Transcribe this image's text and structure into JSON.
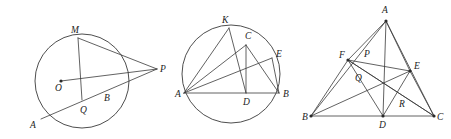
{
  "page": {
    "width": 451,
    "height": 139,
    "background": "#ffffff",
    "ink_color": "#3a3a3a",
    "label_color": "#222222"
  },
  "figures": [
    {
      "id": "figure-1",
      "name": "circle-with-external-point",
      "type": "circle-diagram",
      "bounds": {
        "x": 0,
        "y": 0,
        "width": 160,
        "height": 139
      },
      "circle": {
        "cx": 82,
        "cy": 81,
        "r": 47
      },
      "points": [
        {
          "key": "O",
          "label": "O",
          "x": 61,
          "y": 81,
          "label_x": 55,
          "label_y": 91,
          "dot": true
        },
        {
          "key": "M",
          "label": "M",
          "x": 78,
          "y": 38,
          "label_x": 71,
          "label_y": 33,
          "dot": false
        },
        {
          "key": "P",
          "label": "P",
          "x": 157,
          "y": 69,
          "label_x": 160,
          "label_y": 72,
          "dot": false
        },
        {
          "key": "A",
          "label": "A",
          "x": 41,
          "y": 119,
          "label_x": 30,
          "label_y": 128,
          "dot": false
        },
        {
          "key": "B",
          "label": "B",
          "x": 105,
          "y": 92,
          "label_x": 104,
          "label_y": 101,
          "dot": false
        },
        {
          "key": "Q",
          "label": "Q",
          "x": 82,
          "y": 100,
          "label_x": 80,
          "label_y": 113,
          "dot": false
        }
      ],
      "segments": [
        {
          "from": "M",
          "to": "P",
          "name": "segment-MP"
        },
        {
          "from": "M",
          "to": "Q",
          "name": "segment-MQ"
        },
        {
          "from": "A",
          "to": "P",
          "name": "segment-AP"
        },
        {
          "from": "O",
          "to": "P",
          "name": "segment-OP"
        }
      ]
    },
    {
      "id": "figure-2",
      "name": "circle-with-inscribed-figure",
      "type": "circle-diagram",
      "bounds": {
        "x": 160,
        "y": 0,
        "width": 140,
        "height": 139
      },
      "circle": {
        "cx": 231,
        "cy": 74,
        "r": 49
      },
      "points": [
        {
          "key": "K",
          "label": "K",
          "x": 229,
          "y": 28,
          "label_x": 222,
          "label_y": 23,
          "dot": false
        },
        {
          "key": "C",
          "label": "C",
          "x": 246,
          "y": 45,
          "label_x": 245,
          "label_y": 39,
          "dot": false
        },
        {
          "key": "E",
          "label": "E",
          "x": 272,
          "y": 58,
          "label_x": 276,
          "label_y": 57,
          "dot": false
        },
        {
          "key": "A",
          "label": "A",
          "x": 184,
          "y": 93,
          "label_x": 175,
          "label_y": 97,
          "dot": false
        },
        {
          "key": "D",
          "label": "D",
          "x": 246,
          "y": 93,
          "label_x": 243,
          "label_y": 105,
          "dot": false
        },
        {
          "key": "B",
          "label": "B",
          "x": 279,
          "y": 93,
          "label_x": 283,
          "label_y": 97,
          "dot": false
        }
      ],
      "segments": [
        {
          "from": "A",
          "to": "K",
          "name": "segment-AK"
        },
        {
          "from": "A",
          "to": "C",
          "name": "segment-AC"
        },
        {
          "from": "A",
          "to": "E",
          "name": "segment-AE"
        },
        {
          "from": "A",
          "to": "B",
          "name": "segment-AB"
        },
        {
          "from": "K",
          "to": "D",
          "name": "segment-KD"
        },
        {
          "from": "C",
          "to": "D",
          "name": "segment-CD"
        },
        {
          "from": "C",
          "to": "B",
          "name": "segment-CB"
        },
        {
          "from": "E",
          "to": "B",
          "name": "segment-EB"
        }
      ]
    },
    {
      "id": "figure-3",
      "name": "triangle-with-cevians",
      "type": "triangle-diagram",
      "bounds": {
        "x": 300,
        "y": 0,
        "width": 151,
        "height": 139
      },
      "points": [
        {
          "key": "A",
          "label": "A",
          "x": 386,
          "y": 21,
          "label_x": 382,
          "label_y": 13,
          "dot": true
        },
        {
          "key": "B",
          "label": "B",
          "x": 311,
          "y": 116,
          "label_x": 302,
          "label_y": 120,
          "dot": true
        },
        {
          "key": "C",
          "label": "C",
          "x": 434,
          "y": 116,
          "label_x": 437,
          "label_y": 120,
          "dot": true
        },
        {
          "key": "D",
          "label": "D",
          "x": 383,
          "y": 116,
          "label_x": 379,
          "label_y": 128,
          "dot": true
        },
        {
          "key": "E",
          "label": "E",
          "x": 410,
          "y": 71,
          "label_x": 414,
          "label_y": 69,
          "dot": true
        },
        {
          "key": "F",
          "label": "F",
          "x": 348,
          "y": 60,
          "label_x": 339,
          "label_y": 58,
          "dot": true
        },
        {
          "key": "P",
          "label": "P",
          "x": 366,
          "y": 59,
          "label_x": 364,
          "label_y": 57,
          "dot": false
        },
        {
          "key": "Q",
          "label": "Q",
          "x": 362,
          "y": 80,
          "label_x": 355,
          "label_y": 81,
          "dot": false
        },
        {
          "key": "R",
          "label": "R",
          "x": 401,
          "y": 101,
          "label_x": 399,
          "label_y": 107,
          "dot": false
        }
      ],
      "segments": [
        {
          "from": "A",
          "to": "B",
          "name": "segment-AB"
        },
        {
          "from": "A",
          "to": "C",
          "name": "segment-AC"
        },
        {
          "from": "B",
          "to": "C",
          "name": "segment-BC"
        },
        {
          "from": "A",
          "to": "D",
          "name": "segment-AD"
        },
        {
          "from": "B",
          "to": "E",
          "name": "segment-BE"
        },
        {
          "from": "C",
          "to": "F",
          "name": "segment-CF"
        },
        {
          "from": "F",
          "to": "D",
          "name": "segment-FD"
        },
        {
          "from": "F",
          "to": "E",
          "name": "segment-FE"
        },
        {
          "from": "F",
          "to": "C",
          "name": "segment-FC"
        },
        {
          "from": "D",
          "to": "E",
          "name": "segment-DE"
        },
        {
          "from": "B",
          "to": "F",
          "name": "segment-BF"
        },
        {
          "from": "E",
          "to": "C",
          "name": "segment-EC"
        },
        {
          "from": "A",
          "to": "F",
          "name": "segment-AF"
        },
        {
          "from": "A",
          "to": "E",
          "name": "segment-AE"
        }
      ]
    }
  ]
}
